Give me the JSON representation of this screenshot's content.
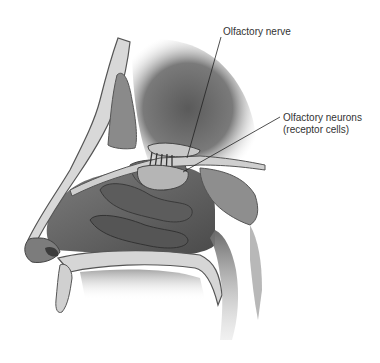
{
  "figure": {
    "labels": [
      {
        "id": "olfactory-nerve",
        "text": "Olfactory nerve"
      },
      {
        "id": "olfactory-neurons",
        "line1": "Olfactory neurons",
        "line2": "(receptor cells)"
      }
    ]
  },
  "colors": {
    "background": "#ffffff",
    "label_text": "#333333",
    "leader_line": "#222222",
    "bone_fill": "#d8d8d8",
    "bone_outline": "#555555",
    "tissue_dark": "#5a5a5a",
    "tissue_mid": "#8a8a8a",
    "brain_shadow": "#6e6e6e"
  }
}
